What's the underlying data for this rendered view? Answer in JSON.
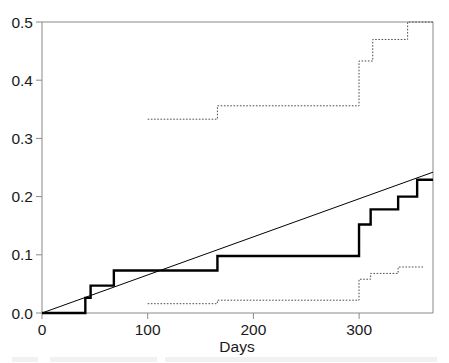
{
  "figure": {
    "background_color": "#ffffff",
    "axis_color": "#8a8a8a",
    "curve_color": "#000000",
    "band_color": "#4d4d4d"
  },
  "chart_data": {
    "type": "line",
    "title": "",
    "subtitle": "",
    "xlabel": "Days",
    "ylabel": "",
    "xlim": [
      0,
      370
    ],
    "ylim": [
      0.0,
      0.5
    ],
    "xticks": [
      0,
      100,
      200,
      300
    ],
    "xtick_labels": [
      "0",
      "100",
      "200",
      "300"
    ],
    "yticks": [
      0.0,
      0.1,
      0.2,
      0.3,
      0.4,
      0.5
    ],
    "ytick_labels": [
      "0.0",
      "0.1",
      "0.2",
      "0.3",
      "0.4",
      "0.5"
    ],
    "grid": false,
    "legend": null,
    "annotations": [],
    "series": [
      {
        "name": "Cumulative incidence (step estimate)",
        "style": "step-post",
        "linewidth": "thick",
        "linestyle": "solid",
        "color": "#000000",
        "x": [
          0,
          41,
          41,
          46,
          46,
          68,
          68,
          166,
          166,
          300,
          300,
          311,
          311,
          337,
          337,
          355,
          355,
          370
        ],
        "y": [
          0.0,
          0.0,
          0.026,
          0.026,
          0.047,
          0.047,
          0.073,
          0.073,
          0.098,
          0.098,
          0.152,
          0.152,
          0.178,
          0.178,
          0.2,
          0.2,
          0.229,
          0.229
        ],
        "steps": [
          {
            "day": 41,
            "value": 0.026
          },
          {
            "day": 46,
            "value": 0.047
          },
          {
            "day": 68,
            "value": 0.073
          },
          {
            "day": 166,
            "value": 0.098
          },
          {
            "day": 300,
            "value": 0.152
          },
          {
            "day": 311,
            "value": 0.178
          },
          {
            "day": 337,
            "value": 0.2
          },
          {
            "day": 355,
            "value": 0.229
          },
          {
            "day": 370,
            "value": 0.256
          }
        ]
      },
      {
        "name": "Reference straight line",
        "style": "line",
        "linewidth": "thin",
        "linestyle": "solid",
        "color": "#000000",
        "x": [
          0,
          370
        ],
        "y": [
          0.0,
          0.242
        ]
      },
      {
        "name": "Upper confidence band",
        "style": "step-post",
        "linewidth": "thin",
        "linestyle": "dotted",
        "color": "#4d4d4d",
        "x": [
          100,
          166,
          166,
          300,
          300,
          313,
          313,
          346,
          346,
          370
        ],
        "y": [
          0.333,
          0.333,
          0.356,
          0.356,
          0.433,
          0.433,
          0.47,
          0.47,
          0.5,
          0.5
        ]
      },
      {
        "name": "Lower confidence band",
        "style": "step-post",
        "linewidth": "thin",
        "linestyle": "dotted",
        "color": "#4d4d4d",
        "x": [
          100,
          166,
          166,
          300,
          300,
          311,
          311,
          337,
          337,
          362
        ],
        "y": [
          0.016,
          0.016,
          0.022,
          0.022,
          0.058,
          0.058,
          0.068,
          0.068,
          0.079,
          0.079
        ]
      }
    ]
  }
}
